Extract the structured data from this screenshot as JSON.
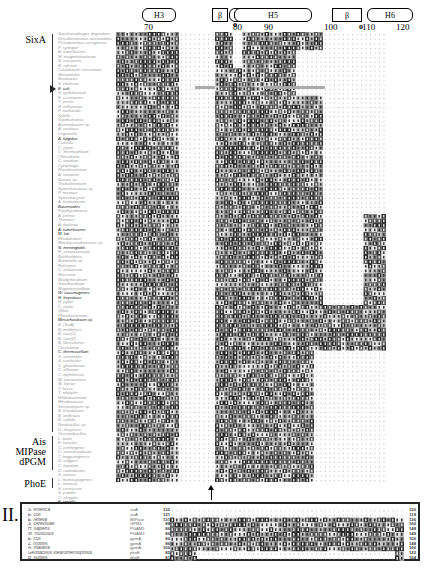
{
  "figure": {
    "secondary_structure": [
      {
        "label": "H3",
        "type": "helix",
        "x": 142,
        "w": 32
      },
      {
        "label": "β",
        "type": "strand",
        "x": 212,
        "w": 14
      },
      {
        "label": "H4",
        "type": "helix",
        "x": 229,
        "w": 18
      },
      {
        "label": "H5",
        "type": "helix",
        "x": 234,
        "w": 76
      },
      {
        "label": "β",
        "type": "strand",
        "x": 332,
        "w": 28
      },
      {
        "label": "H6",
        "type": "helix",
        "x": 367,
        "w": 44
      }
    ],
    "position_ticks": [
      {
        "label": "70",
        "x": 150
      },
      {
        "label": "80",
        "x": 239
      },
      {
        "label": "90",
        "x": 270
      },
      {
        "label": "100",
        "x": 330
      },
      {
        "label": "110",
        "x": 368
      },
      {
        "label": "120",
        "x": 402
      }
    ],
    "markers": [
      {
        "symbol": "o",
        "x": 233,
        "y": 20
      },
      {
        "symbol": "o",
        "x": 359,
        "y": 22
      }
    ],
    "groups": [
      {
        "label": "SixA",
        "top": 34,
        "height": 398
      },
      {
        "label": "Ais",
        "top": 436,
        "height": 10
      },
      {
        "label": "MIPase",
        "top": 446,
        "height": 10
      },
      {
        "label": "dPGM",
        "top": 456,
        "height": 14
      },
      {
        "label": "PhoE",
        "top": 478,
        "height": 10
      }
    ],
    "pointer": {
      "y": 89
    },
    "sequences_panel1": [
      {
        "name": "Saccharophagus degradans",
        "dark": false
      },
      {
        "name": "Desulfuromonas acetoxidans",
        "dark": false
      },
      {
        "name": "Pseudomonas aeruginosa",
        "dark": false
      },
      {
        "name": "P. syringae",
        "dark": false
      },
      {
        "name": "A. tumefaciens",
        "dark": false
      },
      {
        "name": "M. magnetotacticum",
        "dark": false
      },
      {
        "name": "N. europaea",
        "dark": false
      },
      {
        "name": "R. rubrum",
        "dark": false
      },
      {
        "name": "Caulobacter crescentus",
        "dark": false
      },
      {
        "name": "Shewanella",
        "dark": false
      },
      {
        "name": "Geobacter",
        "dark": false
      },
      {
        "name": "V. cholerae",
        "dark": false
      },
      {
        "name": "E. coli",
        "dark": true
      },
      {
        "name": "S. typhimurium",
        "dark": false
      },
      {
        "name": "E. carotovora",
        "dark": false
      },
      {
        "name": "Y. pestis",
        "dark": false
      },
      {
        "name": "H. influenzae",
        "dark": false
      },
      {
        "name": "P. multocida",
        "dark": false
      },
      {
        "name": "Xylella",
        "dark": false
      },
      {
        "name": "Xanthomonas",
        "dark": false
      },
      {
        "name": "Acinetobacter sp.",
        "dark": false
      },
      {
        "name": "A. aeolicus",
        "dark": false
      },
      {
        "name": "Legionella",
        "dark": false
      },
      {
        "name": "A. fulgidus",
        "dark": true
      },
      {
        "name": "Coxiella",
        "dark": false
      },
      {
        "name": "C. jejuni",
        "dark": false
      },
      {
        "name": "C. thermophilum",
        "dark": false
      },
      {
        "name": "Chlorobium",
        "dark": false
      },
      {
        "name": "C. tepidum",
        "dark": false
      },
      {
        "name": "Cytophaga",
        "dark": false
      },
      {
        "name": "Flavobacterium",
        "dark": false
      },
      {
        "name": "A. variabilis",
        "dark": false
      },
      {
        "name": "Nostoc sp.",
        "dark": false
      },
      {
        "name": "Trichodesmium",
        "dark": false
      },
      {
        "name": "Synechococcus sp.",
        "dark": false
      },
      {
        "name": "P. marinus",
        "dark": false
      },
      {
        "name": "Synechocystis",
        "dark": false
      },
      {
        "name": "A. borbonicum",
        "dark": false
      },
      {
        "name": "Bacteroides",
        "dark": true
      },
      {
        "name": "Porphyromonas",
        "dark": false
      },
      {
        "name": "A. pernix",
        "dark": false
      },
      {
        "name": "Thermus",
        "dark": false
      },
      {
        "name": "A. thaliana",
        "dark": false
      },
      {
        "name": "A. tumefaciens",
        "dark": true
      },
      {
        "name": "M. loti",
        "dark": true
      },
      {
        "name": "Rhodobacter",
        "dark": false
      },
      {
        "name": "Rhodopseudomonas sp.",
        "dark": false
      },
      {
        "name": "N. meningitidis",
        "dark": true
      },
      {
        "name": "R. solanacearum",
        "dark": false
      },
      {
        "name": "Burkholderia",
        "dark": false
      },
      {
        "name": "Bordetella sp.",
        "dark": false
      },
      {
        "name": "Ralstonia",
        "dark": false
      },
      {
        "name": "C. violaceum",
        "dark": false
      },
      {
        "name": "Neisseria",
        "dark": false
      },
      {
        "name": "Bradyrhizobium",
        "dark": false
      },
      {
        "name": "Sinorhizobium",
        "dark": false
      },
      {
        "name": "Magnetospirillum",
        "dark": false
      },
      {
        "name": "W. succinogenes",
        "dark": true
      },
      {
        "name": "H. hepaticus",
        "dark": true
      },
      {
        "name": "H. pylori",
        "dark": false
      },
      {
        "name": "C. jejuni",
        "dark": false
      },
      {
        "name": "Vibrio",
        "dark": false
      },
      {
        "name": "Photobacterium",
        "dark": false
      },
      {
        "name": "Mesorhizobium sp.",
        "dark": true
      },
      {
        "name": "B. (SixA)",
        "dark": false
      },
      {
        "name": "B. melitensis",
        "dark": false
      },
      {
        "name": "B. suis(1)",
        "dark": false
      },
      {
        "name": "B. suis(2)",
        "dark": false
      },
      {
        "name": "B. fibrisolvens",
        "dark": false
      },
      {
        "name": "Clostridium",
        "dark": false
      },
      {
        "name": "C. thermocellum",
        "dark": true
      },
      {
        "name": "S. avermitilis",
        "dark": false
      },
      {
        "name": "S. coelicolor",
        "dark": false
      },
      {
        "name": "C. glutamicum",
        "dark": false
      },
      {
        "name": "C. efficiens",
        "dark": false
      },
      {
        "name": "C. diphtheriae",
        "dark": false
      },
      {
        "name": "M. tuberculosis",
        "dark": false
      },
      {
        "name": "M. leprae",
        "dark": false
      },
      {
        "name": "T. fusca",
        "dark": false
      },
      {
        "name": "T. whipplei",
        "dark": false
      },
      {
        "name": "Bifidobacterium",
        "dark": false
      },
      {
        "name": "Rhodococcus",
        "dark": false
      },
      {
        "name": "Streptomyces sp.",
        "dark": false
      },
      {
        "name": "B. halodurans",
        "dark": false
      },
      {
        "name": "B. anthracis",
        "dark": false
      },
      {
        "name": "B. subtilis",
        "dark": false
      },
      {
        "name": "Geobacillus sp.",
        "dark": false
      },
      {
        "name": "O. iheyensis",
        "dark": false
      },
      {
        "name": "Oceanobacillus",
        "dark": false
      },
      {
        "name": "L. lactis",
        "dark": false
      },
      {
        "name": "E. faecalis",
        "dark": false
      },
      {
        "name": "C. perfringens",
        "dark": false
      },
      {
        "name": "C. acetobutylicum",
        "dark": false
      },
      {
        "name": "T. tengcongensis",
        "dark": false
      },
      {
        "name": "D. vulgaris",
        "dark": false
      },
      {
        "name": "C. tepidum",
        "dark": false
      },
      {
        "name": "D. radiodurans",
        "dark": false
      },
      {
        "name": "S. aureus",
        "dark": false
      },
      {
        "name": "L. monocytogenes",
        "dark": false
      },
      {
        "name": "L. innocua",
        "dark": false
      },
      {
        "name": "S. cerevisiae",
        "dark": false
      },
      {
        "name": "S. pombe",
        "dark": false
      },
      {
        "name": "C. elegans",
        "dark": false
      },
      {
        "name": "E. tenella",
        "dark": true
      },
      {
        "name": "S. cerevisiae",
        "dark": true
      },
      {
        "name": "H. sapiens",
        "dark": true
      },
      {
        "name": "M. musculus",
        "dark": true
      },
      {
        "name": "E. coli",
        "dark": false
      },
      {
        "name": "Z. mobilis",
        "dark": false
      },
      {
        "name": "A. thaliana",
        "dark": true
      },
      {
        "name": "Geobacillus stearothermophilus",
        "dark": false
      },
      {
        "name": "B. subtilis",
        "dark": false
      }
    ],
    "panel2": {
      "roman": "II.",
      "rows": [
        {
          "name": "S. enterica",
          "id": "sixA",
          "start": "132",
          "end": "120"
        },
        {
          "name": "E. coli",
          "id": "sixA",
          "start": "131",
          "end": "119"
        },
        {
          "name": "E. tenella",
          "id": "MIPase",
          "start": "131",
          "end": "126"
        },
        {
          "name": "S. cerevisiae",
          "id": "GPM1",
          "start": "88",
          "end": "160"
        },
        {
          "name": "H. sapiens",
          "id": "PGAM1",
          "start": "86",
          "end": "148"
        },
        {
          "name": "M. musculus",
          "id": "PGAM2",
          "start": "86",
          "end": "149"
        },
        {
          "name": "E. coli",
          "id": "gpmA",
          "start": "86",
          "end": "150"
        },
        {
          "name": "Z. mobilis",
          "id": "gpmA",
          "start": "86",
          "end": "148"
        },
        {
          "name": "A. thaliana",
          "id": "gpmA",
          "start": "100",
          "end": "166"
        },
        {
          "name": "Geobacillus stearothermophilus",
          "id": "phoE",
          "start": "85",
          "end": "122"
        },
        {
          "name": "B. subtilis",
          "id": "phoE",
          "start": "81",
          "end": "104"
        }
      ]
    }
  }
}
